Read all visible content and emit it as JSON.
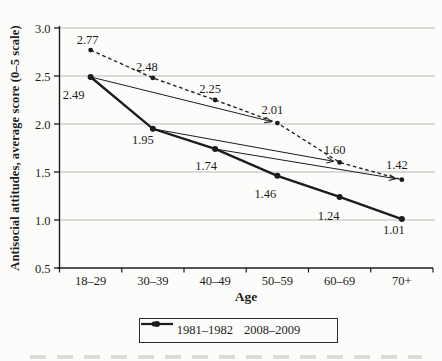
{
  "chart_data": {
    "type": "line",
    "xlabel": "Age",
    "ylabel": "Antisocial attitudes, average score (0–5 scale)",
    "categories": [
      "18–29",
      "30–39",
      "40–49",
      "50–59",
      "60–69",
      "70+"
    ],
    "ylim": [
      0.5,
      3.0
    ],
    "yticks": [
      "3.0",
      "2.5",
      "2.0",
      "1.5",
      "1.0",
      "0.5"
    ],
    "grid": "horizontal",
    "legend_position": "bottom",
    "series": [
      {
        "name": "1981–1982",
        "style": "solid",
        "label_position": "below",
        "values": [
          2.49,
          1.95,
          1.74,
          1.46,
          1.24,
          1.01
        ],
        "labels": [
          "2.49",
          "1.95",
          "1.74",
          "1.46",
          "1.24",
          "1.01"
        ]
      },
      {
        "name": "2008–2009",
        "style": "dashed",
        "label_position": "above",
        "values": [
          2.77,
          2.48,
          2.25,
          2.01,
          1.6,
          1.42
        ],
        "labels": [
          "2.77",
          "2.48",
          "2.25",
          "2.01",
          "1.60",
          "1.42"
        ]
      }
    ],
    "cohort_arrows": [
      {
        "from_series": "1981–1982",
        "from_category": "18–29",
        "to_series": "2008–2009",
        "to_category": "50–59"
      },
      {
        "from_series": "1981–1982",
        "from_category": "30–39",
        "to_series": "2008–2009",
        "to_category": "60–69"
      },
      {
        "from_series": "1981–1982",
        "from_category": "40–49",
        "to_series": "2008–2009",
        "to_category": "70+"
      }
    ],
    "colors": {
      "line": "#1c1c1c",
      "grid": "#b9b9b6",
      "text": "#1c1c1c",
      "background": "#fcfcfa"
    }
  }
}
